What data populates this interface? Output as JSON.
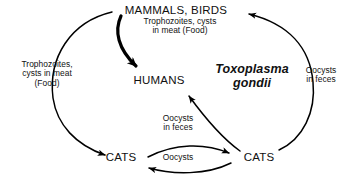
{
  "diagram": {
    "species": "Toxoplasma gondii",
    "species_line1": "Toxoplasma",
    "species_line2": "gondii",
    "ink_color": "#000000",
    "background_color": "#ffffff",
    "nodes": {
      "mammals_birds": "MAMMALS, BIRDS",
      "humans": "HUMANS",
      "cats_left": "CATS",
      "cats_right": "CATS"
    },
    "edge_labels": {
      "top_meat": "Trophozoites, cysts\nin meat (Food)",
      "left_meat": "Trophozoites,\ncysts in meat\n(Food)",
      "right_feces": "Oocysts\nin feces",
      "middle_feces": "Oocysts\nin feces",
      "bottom_oocysts": "Oocysts"
    },
    "edges": [
      {
        "name": "mammals-to-humans",
        "from": "MAMMALS, BIRDS",
        "to": "HUMANS",
        "label": "Trophozoites, cysts in meat (Food)",
        "style": "thick-curved-arrow"
      },
      {
        "name": "mammals-to-cats-left",
        "from": "MAMMALS, BIRDS",
        "to": "CATS (left)",
        "label": "Trophozoites, cysts in meat (Food)",
        "style": "thin-arc-arrow"
      },
      {
        "name": "cats-right-to-mammals",
        "from": "CATS (right)",
        "to": "MAMMALS, BIRDS",
        "label": "Oocysts in feces",
        "style": "thin-arc-arrow"
      },
      {
        "name": "cats-right-to-humans",
        "from": "CATS (right)",
        "to": "HUMANS",
        "label": "Oocysts in feces",
        "style": "thin-straight-arrow"
      },
      {
        "name": "cats-left-to-cats-right",
        "from": "CATS (left)",
        "to": "CATS (right)",
        "label": "Oocysts",
        "style": "thin-arc-arrow"
      },
      {
        "name": "cats-right-to-cats-left",
        "from": "CATS (right)",
        "to": "CATS (left)",
        "label": "Oocysts",
        "style": "thin-arc-arrow"
      }
    ]
  }
}
